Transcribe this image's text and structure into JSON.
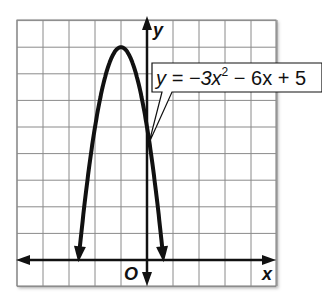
{
  "chart_data": {
    "type": "line",
    "title": "",
    "equation": "y = -3x^2 - 6x + 5",
    "callout": {
      "prefix": "y = −3x",
      "exponent": "2",
      "suffix": " − 6x + 5"
    },
    "xlabel": "x",
    "ylabel": "y",
    "origin_label": "O",
    "xlim": [
      -5,
      5
    ],
    "ylim": [
      -1,
      9
    ],
    "grid": true,
    "grid_step": 1,
    "vertex": [
      -1,
      8
    ],
    "y_intercept": [
      0,
      5
    ],
    "series": [
      {
        "name": "y = -3x^2 - 6x + 5",
        "x": [
          -2.6,
          -2.5,
          -2,
          -1.5,
          -1,
          -0.5,
          0,
          0.5,
          0.6
        ],
        "y": [
          -0.68,
          0.25,
          5,
          7.25,
          8,
          7.25,
          5,
          1.25,
          0.32
        ]
      }
    ],
    "colors": {
      "curve": "#111111",
      "grid": "#8a8a8a",
      "axes": "#111111",
      "background": "#ffffff"
    }
  }
}
